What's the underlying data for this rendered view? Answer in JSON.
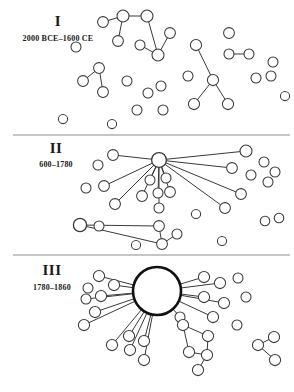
{
  "figure": {
    "width": 294,
    "height": 392,
    "background": "#ffffff",
    "node_fill": "#ffffff",
    "node_stroke": "#3a3a3a",
    "edge_color": "#3a3a3a",
    "separator_color": "#8c8c8c"
  },
  "chart_data": {
    "type": "diagram",
    "subtype": "node-link-network",
    "xlabel": "",
    "ylabel": "",
    "grid": false,
    "legend": "none",
    "panels": [
      {
        "id": "panel-1",
        "roman": "I",
        "period": "2000 BCE–1600 CE",
        "label_x": 58,
        "label_y": 26,
        "period_x": 58,
        "period_y": 41,
        "separator": {
          "x1": 13,
          "y1": 135,
          "x2": 290,
          "y2": 135
        },
        "description": "Many small disconnected components and isolates; no dominant hub",
        "node_count": 30,
        "edge_count": 12,
        "largest_component_size": 6,
        "nodes": [
          {
            "id": "a1",
            "x": 103,
            "y": 22,
            "r": 5.4
          },
          {
            "id": "a2",
            "x": 123,
            "y": 16,
            "r": 6.0
          },
          {
            "id": "a3",
            "x": 147,
            "y": 16,
            "r": 6.0
          },
          {
            "id": "a4",
            "x": 118,
            "y": 41,
            "r": 5.4
          },
          {
            "id": "a5",
            "x": 158,
            "y": 55,
            "r": 6.0
          },
          {
            "id": "a6",
            "x": 170,
            "y": 33,
            "r": 5.4
          },
          {
            "id": "a7",
            "x": 140,
            "y": 45,
            "r": 5.0
          },
          {
            "id": "b1",
            "x": 76,
            "y": 47,
            "r": 5.0
          },
          {
            "id": "c1",
            "x": 99,
            "y": 68,
            "r": 5.4
          },
          {
            "id": "c2",
            "x": 83,
            "y": 81,
            "r": 5.4
          },
          {
            "id": "c3",
            "x": 103,
            "y": 92,
            "r": 5.4
          },
          {
            "id": "d1",
            "x": 127,
            "y": 81,
            "r": 5.0
          },
          {
            "id": "d2",
            "x": 148,
            "y": 93,
            "r": 5.0
          },
          {
            "id": "d3",
            "x": 161,
            "y": 86,
            "r": 5.0
          },
          {
            "id": "d4",
            "x": 137,
            "y": 110,
            "r": 5.0
          },
          {
            "id": "d5",
            "x": 163,
            "y": 110,
            "r": 5.0
          },
          {
            "id": "e1",
            "x": 196,
            "y": 45,
            "r": 5.6
          },
          {
            "id": "e2",
            "x": 213,
            "y": 80,
            "r": 5.6
          },
          {
            "id": "e3",
            "x": 194,
            "y": 104,
            "r": 5.6
          },
          {
            "id": "e4",
            "x": 228,
            "y": 104,
            "r": 5.6
          },
          {
            "id": "e5",
            "x": 188,
            "y": 76,
            "r": 5.0
          },
          {
            "id": "f1",
            "x": 229,
            "y": 33,
            "r": 5.4
          },
          {
            "id": "g1",
            "x": 229,
            "y": 54,
            "r": 5.0
          },
          {
            "id": "g2",
            "x": 249,
            "y": 54,
            "r": 5.0
          },
          {
            "id": "h1",
            "x": 273,
            "y": 62,
            "r": 5.0
          },
          {
            "id": "h2",
            "x": 256,
            "y": 78,
            "r": 5.0
          },
          {
            "id": "h3",
            "x": 271,
            "y": 76,
            "r": 5.0
          },
          {
            "id": "i1",
            "x": 63,
            "y": 119,
            "r": 4.6
          },
          {
            "id": "j1",
            "x": 285,
            "y": 96,
            "r": 4.6
          },
          {
            "id": "k1",
            "x": 112,
            "y": 124,
            "r": 4.6
          }
        ],
        "edges": [
          [
            "a1",
            "a2"
          ],
          [
            "a2",
            "a3"
          ],
          [
            "a2",
            "a4"
          ],
          [
            "a3",
            "a5"
          ],
          [
            "a5",
            "a6"
          ],
          [
            "a5",
            "a7"
          ],
          [
            "c1",
            "c2"
          ],
          [
            "c1",
            "c3"
          ],
          [
            "e1",
            "e2"
          ],
          [
            "e2",
            "e3"
          ],
          [
            "e2",
            "e4"
          ],
          [
            "g1",
            "g2"
          ]
        ]
      },
      {
        "id": "panel-2",
        "roman": "II",
        "period": "600–1780",
        "label_x": 56,
        "label_y": 153,
        "period_x": 56,
        "period_y": 167,
        "separator": {
          "x1": 13,
          "y1": 255,
          "x2": 290,
          "y2": 255
        },
        "description": "A medium hub acquires many spokes; a secondary hub emerges at lower left",
        "node_count": 30,
        "edge_count": 17,
        "largest_component_size": 15,
        "hub": {
          "id": "H2",
          "x": 159,
          "y": 160,
          "r": 7.4,
          "degree": 13
        },
        "nodes": [
          {
            "id": "H2",
            "x": 159,
            "y": 160,
            "r": 7.4,
            "hub": true
          },
          {
            "id": "s1",
            "x": 113,
            "y": 155,
            "r": 5.4
          },
          {
            "id": "s2",
            "x": 246,
            "y": 151,
            "r": 6.0
          },
          {
            "id": "s3",
            "x": 232,
            "y": 168,
            "r": 5.4
          },
          {
            "id": "s4",
            "x": 241,
            "y": 194,
            "r": 5.4
          },
          {
            "id": "s5",
            "x": 225,
            "y": 208,
            "r": 5.4
          },
          {
            "id": "s6",
            "x": 104,
            "y": 186,
            "r": 5.4
          },
          {
            "id": "s7",
            "x": 115,
            "y": 204,
            "r": 5.4
          },
          {
            "id": "s8",
            "x": 142,
            "y": 196,
            "r": 5.4
          },
          {
            "id": "s9",
            "x": 158,
            "y": 193,
            "r": 5.0
          },
          {
            "id": "s10",
            "x": 159,
            "y": 208,
            "r": 5.0
          },
          {
            "id": "s11",
            "x": 170,
            "y": 192,
            "r": 5.4
          },
          {
            "id": "s12",
            "x": 150,
            "y": 180,
            "r": 5.0
          },
          {
            "id": "s13",
            "x": 166,
            "y": 178,
            "r": 5.0
          },
          {
            "id": "H2b",
            "x": 80,
            "y": 225,
            "r": 6.6,
            "hub": true
          },
          {
            "id": "t1",
            "x": 159,
            "y": 226,
            "r": 5.4
          },
          {
            "id": "t2",
            "x": 162,
            "y": 244,
            "r": 5.4
          },
          {
            "id": "t3",
            "x": 177,
            "y": 234,
            "r": 5.0
          },
          {
            "id": "u1",
            "x": 99,
            "y": 226,
            "r": 5.0
          },
          {
            "id": "v1",
            "x": 98,
            "y": 165,
            "r": 5.0
          },
          {
            "id": "v2",
            "x": 86,
            "y": 188,
            "r": 5.0
          },
          {
            "id": "v3",
            "x": 264,
            "y": 162,
            "r": 5.0
          },
          {
            "id": "v4",
            "x": 275,
            "y": 172,
            "r": 5.0
          },
          {
            "id": "v5",
            "x": 251,
            "y": 175,
            "r": 5.0
          },
          {
            "id": "v6",
            "x": 268,
            "y": 182,
            "r": 5.0
          },
          {
            "id": "v7",
            "x": 265,
            "y": 221,
            "r": 4.8
          },
          {
            "id": "v8",
            "x": 279,
            "y": 218,
            "r": 4.8
          },
          {
            "id": "v9",
            "x": 136,
            "y": 245,
            "r": 4.6
          },
          {
            "id": "v10",
            "x": 222,
            "y": 241,
            "r": 4.6
          },
          {
            "id": "v11",
            "x": 196,
            "y": 214,
            "r": 4.6
          }
        ],
        "edges": [
          [
            "H2",
            "s1"
          ],
          [
            "H2",
            "s2"
          ],
          [
            "H2",
            "s3"
          ],
          [
            "H2",
            "s4"
          ],
          [
            "H2",
            "s5"
          ],
          [
            "H2",
            "s6"
          ],
          [
            "H2",
            "s7"
          ],
          [
            "H2",
            "s8"
          ],
          [
            "H2",
            "s9"
          ],
          [
            "H2",
            "s10"
          ],
          [
            "H2",
            "s11"
          ],
          [
            "H2",
            "s12"
          ],
          [
            "H2",
            "s13"
          ],
          [
            "H2b",
            "t1"
          ],
          [
            "H2b",
            "t2"
          ],
          [
            "t1",
            "t2"
          ],
          [
            "t2",
            "t3"
          ]
        ]
      },
      {
        "id": "panel-3",
        "roman": "III",
        "period": "1780–1860",
        "label_x": 52,
        "label_y": 275,
        "period_x": 52,
        "period_y": 290,
        "separator": null,
        "description": "A single large dominant hub absorbs most nodes; a few peripheral clusters remain",
        "node_count": 30,
        "edge_count": 22,
        "largest_component_size": 21,
        "hub": {
          "id": "H3",
          "x": 157,
          "y": 291,
          "r": 24.0,
          "degree": 17
        },
        "nodes": [
          {
            "id": "H3",
            "x": 157,
            "y": 291,
            "r": 24.0,
            "hub": true
          },
          {
            "id": "p1",
            "x": 99,
            "y": 276,
            "r": 5.6
          },
          {
            "id": "p2",
            "x": 114,
            "y": 285,
            "r": 5.6
          },
          {
            "id": "p3",
            "x": 101,
            "y": 296,
            "r": 5.6
          },
          {
            "id": "p4",
            "x": 95,
            "y": 312,
            "r": 5.6
          },
          {
            "id": "p5",
            "x": 84,
            "y": 325,
            "r": 5.6
          },
          {
            "id": "p6",
            "x": 112,
            "y": 345,
            "r": 5.6
          },
          {
            "id": "p7",
            "x": 130,
            "y": 350,
            "r": 5.6
          },
          {
            "id": "p8",
            "x": 129,
            "y": 336,
            "r": 5.6
          },
          {
            "id": "p9",
            "x": 144,
            "y": 341,
            "r": 5.6
          },
          {
            "id": "p10",
            "x": 144,
            "y": 360,
            "r": 5.6
          },
          {
            "id": "p11",
            "x": 204,
            "y": 277,
            "r": 5.6
          },
          {
            "id": "p12",
            "x": 220,
            "y": 283,
            "r": 5.6
          },
          {
            "id": "p13",
            "x": 204,
            "y": 297,
            "r": 5.6
          },
          {
            "id": "p14",
            "x": 224,
            "y": 303,
            "r": 5.6
          },
          {
            "id": "p15",
            "x": 213,
            "y": 317,
            "r": 5.6
          },
          {
            "id": "p16",
            "x": 86,
            "y": 299,
            "r": 5.0
          },
          {
            "id": "p17",
            "x": 88,
            "y": 288,
            "r": 5.0
          },
          {
            "id": "q1",
            "x": 180,
            "y": 317,
            "r": 5.0
          },
          {
            "id": "q2",
            "x": 238,
            "y": 278,
            "r": 5.0
          },
          {
            "id": "q3",
            "x": 246,
            "y": 297,
            "r": 5.0
          },
          {
            "id": "q4",
            "x": 237,
            "y": 325,
            "r": 5.0
          },
          {
            "id": "r1",
            "x": 183,
            "y": 325,
            "r": 5.6
          },
          {
            "id": "r2",
            "x": 208,
            "y": 336,
            "r": 5.6
          },
          {
            "id": "r3",
            "x": 189,
            "y": 352,
            "r": 5.6
          },
          {
            "id": "r4",
            "x": 207,
            "y": 355,
            "r": 5.6
          },
          {
            "id": "r5",
            "x": 198,
            "y": 370,
            "r": 5.6
          },
          {
            "id": "w1",
            "x": 258,
            "y": 345,
            "r": 5.6
          },
          {
            "id": "w2",
            "x": 274,
            "y": 337,
            "r": 5.6
          },
          {
            "id": "w3",
            "x": 275,
            "y": 360,
            "r": 5.6
          }
        ],
        "edges": [
          [
            "H3",
            "p1"
          ],
          [
            "H3",
            "p2"
          ],
          [
            "H3",
            "p3"
          ],
          [
            "H3",
            "p4"
          ],
          [
            "H3",
            "p5"
          ],
          [
            "H3",
            "p6"
          ],
          [
            "H3",
            "p7"
          ],
          [
            "H3",
            "p8"
          ],
          [
            "H3",
            "p9"
          ],
          [
            "H3",
            "p10"
          ],
          [
            "H3",
            "p11"
          ],
          [
            "H3",
            "p12"
          ],
          [
            "H3",
            "p13"
          ],
          [
            "H3",
            "p14"
          ],
          [
            "H3",
            "p15"
          ],
          [
            "H3",
            "p16"
          ],
          [
            "H3",
            "q1"
          ],
          [
            "r1",
            "r2"
          ],
          [
            "r1",
            "r3"
          ],
          [
            "r3",
            "r4"
          ],
          [
            "r2",
            "r4"
          ],
          [
            "r4",
            "r5"
          ],
          [
            "w1",
            "w2"
          ],
          [
            "w1",
            "w3"
          ]
        ]
      }
    ]
  }
}
